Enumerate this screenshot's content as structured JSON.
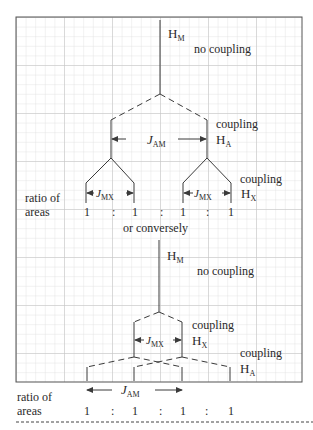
{
  "colors": {
    "grid_minor": "#d9d9d9",
    "grid_major": "#bdbdbd",
    "frame": "#555555",
    "line": "#3a3a3a",
    "text": "#2a2a2a"
  },
  "top_tree": {
    "hm_label": "H",
    "hm_sub": "M",
    "no_coupling": "no coupling",
    "coupling_a": "coupling",
    "ha_label": "H",
    "ha_sub": "A",
    "jam_label": "J",
    "jam_sub": "AM",
    "coupling_x": "coupling",
    "hx_label": "H",
    "hx_sub": "X",
    "jmx_left_label": "J",
    "jmx_left_sub": "MX",
    "jmx_right_label": "J",
    "jmx_right_sub": "MX",
    "ratio_of": "ratio of",
    "areas": "areas",
    "ratio_values": [
      "1",
      ":",
      "1",
      ":",
      "1",
      ":",
      "1"
    ]
  },
  "separator_text": "or conversely",
  "bottom_tree": {
    "hm_label": "H",
    "hm_sub": "M",
    "no_coupling": "no coupling",
    "coupling_x": "coupling",
    "hx_label": "H",
    "hx_sub": "X",
    "jmx_label": "J",
    "jmx_sub": "MX",
    "coupling_a": "coupling",
    "ha_label": "H",
    "ha_sub": "A",
    "jam_label": "J",
    "jam_sub": "AM",
    "ratio_of": "ratio of",
    "areas": "areas",
    "ratio_values": [
      "1",
      ":",
      "1",
      ":",
      "1",
      ":",
      "1"
    ]
  }
}
